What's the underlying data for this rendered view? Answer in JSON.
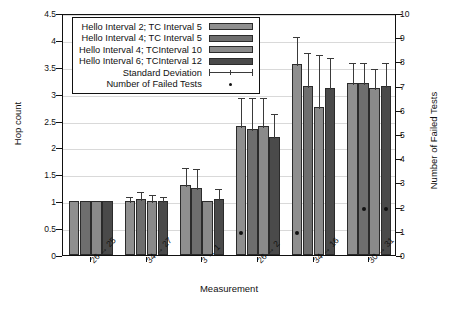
{
  "chart_data": {
    "type": "bar",
    "title": "",
    "xlabel": "Measurement",
    "ylabel": "Hop count",
    "ylabel_right": "Number of Failed Tests",
    "categories": [
      "26 → 25",
      "34 → 27",
      "3 → 1",
      "26 → 2",
      "34 → 16",
      "30 → 31"
    ],
    "ylim": [
      0,
      4.5
    ],
    "ylim_right": [
      0,
      10
    ],
    "yticks": [
      "0",
      "0.5",
      "1",
      "1.5",
      "2",
      "2.5",
      "3",
      "3.5",
      "4",
      "4.5"
    ],
    "yticks_right": [
      "0",
      "1",
      "2",
      "3",
      "4",
      "5",
      "6",
      "7",
      "8",
      "9",
      "10"
    ],
    "grid": true,
    "legend_position": "top-left-inside",
    "series": [
      {
        "name": "Hello Interval 2; TC Interval 5",
        "color": "#8f8f8f",
        "values": [
          1.0,
          1.0,
          1.3,
          2.4,
          3.55,
          3.2
        ],
        "errors": [
          0.0,
          0.12,
          0.35,
          0.55,
          0.55,
          0.4
        ]
      },
      {
        "name": "Hello Interval 4; TC Interval 5",
        "color": "#6e6e6e",
        "values": [
          1.0,
          1.05,
          1.25,
          2.35,
          3.15,
          3.2
        ],
        "errors": [
          0.0,
          0.15,
          0.38,
          0.6,
          0.65,
          0.4
        ]
      },
      {
        "name": "Hello Interval 4; TCInterval 10",
        "color": "#8a8a8a",
        "values": [
          1.0,
          1.0,
          1.0,
          2.4,
          2.75,
          3.1
        ],
        "errors": [
          0.0,
          0.15,
          0.0,
          0.55,
          1.0,
          0.4
        ]
      },
      {
        "name": "Hello Interval 6; TCInterval 12",
        "color": "#4a4a4a",
        "values": [
          1.0,
          1.0,
          1.05,
          2.2,
          3.1,
          3.15
        ],
        "errors": [
          0.0,
          0.12,
          0.22,
          0.45,
          0.6,
          0.45
        ]
      }
    ],
    "standard_deviation_label": "Standard Deviation",
    "failed_tests_label": "Number of Failed Tests",
    "failed_tests": [
      {
        "group": 3,
        "series": 0,
        "value": 1
      },
      {
        "group": 4,
        "series": 0,
        "value": 1
      },
      {
        "group": 5,
        "series": 1,
        "value": 2
      },
      {
        "group": 5,
        "series": 3,
        "value": 2
      }
    ]
  },
  "caption": ""
}
